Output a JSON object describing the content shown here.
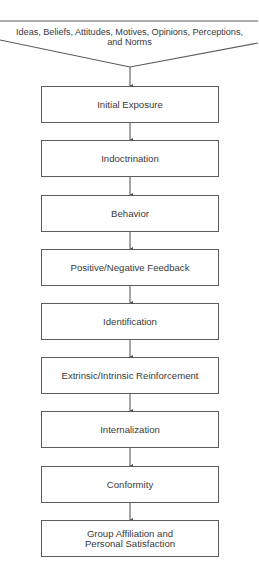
{
  "diagram": {
    "source": {
      "line1": "Ideas, Beliefs, Attitudes, Motives, Opinions, Perceptions,",
      "line2": "and Norms"
    },
    "steps": [
      {
        "label": "Initial Exposure"
      },
      {
        "label": "Indoctrination"
      },
      {
        "label": "Behavior"
      },
      {
        "label": "Positive/Negative Feedback"
      },
      {
        "label": "Identification"
      },
      {
        "label": "Extrinsic/Intrinsic Reinforcement"
      },
      {
        "label": "Internalization"
      },
      {
        "label": "Conformity"
      },
      {
        "label": "Group Affiliation and",
        "label_2": "Personal Satisfaction"
      }
    ],
    "colors": {
      "stroke": "#5c5c5c",
      "text": "#3a3a3a",
      "background": "#ffffff"
    }
  }
}
